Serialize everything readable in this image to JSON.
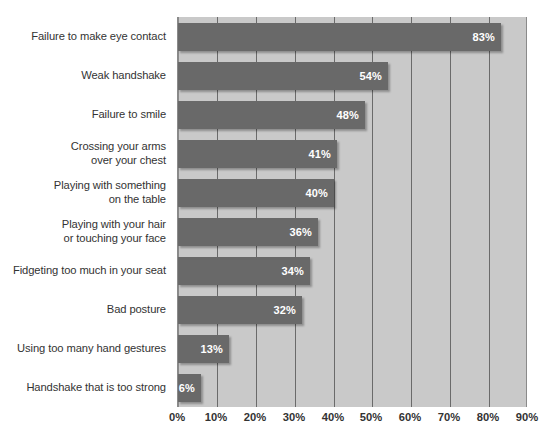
{
  "chart_data": {
    "type": "bar",
    "orientation": "horizontal",
    "title": "",
    "subtitle": "",
    "xlabel": "",
    "ylabel": "",
    "xlim": [
      0,
      90
    ],
    "grid": true,
    "legend": false,
    "legend_position": "none",
    "value_suffix": "%",
    "categories": [
      "Failure to make eye contact",
      "Weak handshake",
      "Failure to smile",
      "Crossing your arms over your chest",
      "Playing with something on the table",
      "Playing with your hair or touching your face",
      "Fidgeting too much in your seat",
      "Bad posture",
      "Using too many hand gestures",
      "Handshake that is too strong"
    ],
    "category_lines": [
      [
        "Failure to make eye contact"
      ],
      [
        "Weak handshake"
      ],
      [
        "Failure to smile"
      ],
      [
        "Crossing your arms",
        "over your chest"
      ],
      [
        "Playing with something",
        "on the table"
      ],
      [
        "Playing with your hair",
        "or touching your face"
      ],
      [
        "Fidgeting too much in your seat"
      ],
      [
        "Bad posture"
      ],
      [
        "Using too many hand gestures"
      ],
      [
        "Handshake that is too strong"
      ]
    ],
    "values": [
      83,
      54,
      48,
      41,
      40,
      36,
      34,
      32,
      13,
      6
    ],
    "value_labels": [
      "83%",
      "54%",
      "48%",
      "41%",
      "40%",
      "36%",
      "34%",
      "32%",
      "13%",
      "6%"
    ],
    "xticks": [
      0,
      10,
      20,
      30,
      40,
      50,
      60,
      70,
      80,
      90
    ],
    "xtick_labels": [
      "0%",
      "10%",
      "20%",
      "30%",
      "40%",
      "50%",
      "60%",
      "70%",
      "80%",
      "90%"
    ]
  },
  "colors": {
    "bar": "#696969",
    "plot_background": "#c9c9c9",
    "gridline": "#6a6a6a",
    "page_background": "#ffffff",
    "label_text": "#333333",
    "value_text": "#ffffff"
  }
}
